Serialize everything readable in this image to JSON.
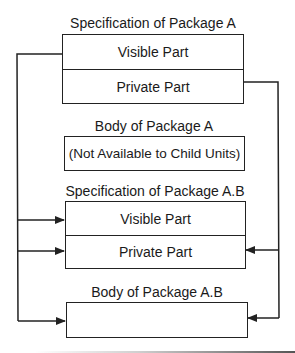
{
  "diagram": {
    "spec_a": {
      "title": "Specification of Package A",
      "visible_part": "Visible Part",
      "private_part": "Private Part"
    },
    "body_a": {
      "title": "Body of Package A",
      "content": "(Not Available to Child Units)"
    },
    "spec_ab": {
      "title": "Specification of Package A.B",
      "visible_part": "Visible Part",
      "private_part": "Private Part"
    },
    "body_ab": {
      "title": "Body of Package A.B",
      "content": ""
    },
    "connections": [
      {
        "from": "spec_a.visible_part",
        "to": [
          "spec_ab.visible_part",
          "spec_ab.private_part",
          "body_ab"
        ],
        "side": "left"
      },
      {
        "from": "spec_a.private_part",
        "to": [
          "spec_ab.private_part",
          "body_ab"
        ],
        "side": "right"
      }
    ],
    "colors": {
      "line": "#222222",
      "background": "#ffffff"
    }
  }
}
